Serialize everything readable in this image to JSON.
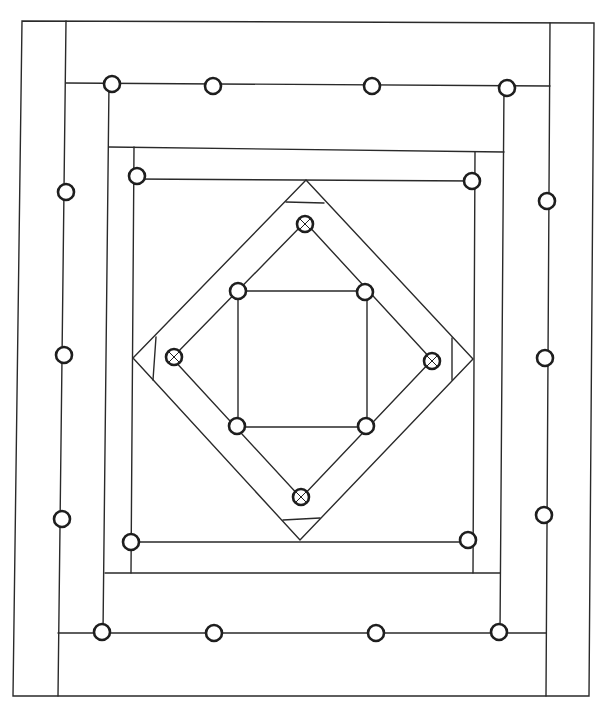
{
  "diagram": {
    "title": "",
    "type": "quilt-block-line-drawing",
    "colors": {
      "background": "#ffffff",
      "line": "#2a2a2a",
      "marker": "#1e1e1e"
    },
    "frames": [
      {
        "name": "outer-border",
        "points": [
          [
            22,
            21
          ],
          [
            594,
            23
          ],
          [
            589,
            696
          ],
          [
            13,
            696
          ]
        ]
      },
      {
        "name": "left-strip-inner-edge",
        "points": [
          [
            66,
            21
          ],
          [
            58,
            696
          ]
        ]
      },
      {
        "name": "right-strip-inner-edge",
        "points": [
          [
            550,
            23
          ],
          [
            546,
            696
          ]
        ]
      },
      {
        "name": "top-strip-bottom-edge",
        "points": [
          [
            66,
            83
          ],
          [
            550,
            86
          ]
        ]
      },
      {
        "name": "bottom-strip-top-edge",
        "points": [
          [
            58,
            633
          ],
          [
            546,
            633
          ]
        ]
      },
      {
        "name": "second-frame-left",
        "points": [
          [
            109,
            83
          ],
          [
            103,
            633
          ]
        ]
      },
      {
        "name": "second-frame-right",
        "points": [
          [
            504,
            86
          ],
          [
            500,
            633
          ]
        ]
      },
      {
        "name": "second-frame-top",
        "points": [
          [
            109,
            147
          ],
          [
            504,
            152
          ]
        ]
      },
      {
        "name": "second-frame-bottom",
        "points": [
          [
            105,
            573
          ],
          [
            500,
            573
          ]
        ]
      },
      {
        "name": "inner-square-left",
        "points": [
          [
            134,
            147
          ],
          [
            131,
            573
          ]
        ]
      },
      {
        "name": "inner-square-right",
        "points": [
          [
            475,
            152
          ],
          [
            473,
            573
          ]
        ]
      },
      {
        "name": "inner-square-top",
        "points": [
          [
            134,
            179
          ],
          [
            475,
            181
          ]
        ]
      },
      {
        "name": "inner-square-bottom",
        "points": [
          [
            131,
            542
          ],
          [
            473,
            542
          ]
        ]
      }
    ],
    "outer_diamond": [
      [
        306,
        180
      ],
      [
        473,
        359
      ],
      [
        300,
        540
      ],
      [
        133,
        358
      ]
    ],
    "inner_diamond": [
      [
        305,
        222
      ],
      [
        432,
        360
      ],
      [
        301,
        498
      ],
      [
        172,
        358
      ]
    ],
    "center_square": [
      [
        238,
        291
      ],
      [
        367,
        291
      ],
      [
        367,
        427
      ],
      [
        238,
        427
      ]
    ],
    "diamond_cross_bars": [
      [
        [
          286,
          202
        ],
        [
          324,
          203
        ]
      ],
      [
        [
          156,
          337
        ],
        [
          153,
          380
        ]
      ],
      [
        [
          452,
          338
        ],
        [
          452,
          380
        ]
      ],
      [
        [
          283,
          520
        ],
        [
          320,
          518
        ]
      ]
    ],
    "markers": [
      {
        "x": 112,
        "y": 84,
        "r": 8,
        "crossed": false
      },
      {
        "x": 213,
        "y": 86,
        "r": 8,
        "crossed": false
      },
      {
        "x": 372,
        "y": 86,
        "r": 8,
        "crossed": false
      },
      {
        "x": 507,
        "y": 88,
        "r": 8,
        "crossed": false
      },
      {
        "x": 66,
        "y": 192,
        "r": 8,
        "crossed": false
      },
      {
        "x": 137,
        "y": 176,
        "r": 8,
        "crossed": false
      },
      {
        "x": 472,
        "y": 181,
        "r": 8,
        "crossed": false
      },
      {
        "x": 547,
        "y": 201,
        "r": 8,
        "crossed": false
      },
      {
        "x": 64,
        "y": 355,
        "r": 8,
        "crossed": false
      },
      {
        "x": 545,
        "y": 358,
        "r": 8,
        "crossed": false
      },
      {
        "x": 62,
        "y": 519,
        "r": 8,
        "crossed": false
      },
      {
        "x": 544,
        "y": 515,
        "r": 8,
        "crossed": false
      },
      {
        "x": 131,
        "y": 542,
        "r": 8,
        "crossed": false
      },
      {
        "x": 468,
        "y": 540,
        "r": 8,
        "crossed": false
      },
      {
        "x": 102,
        "y": 632,
        "r": 8,
        "crossed": false
      },
      {
        "x": 214,
        "y": 633,
        "r": 8,
        "crossed": false
      },
      {
        "x": 376,
        "y": 633,
        "r": 8,
        "crossed": false
      },
      {
        "x": 499,
        "y": 632,
        "r": 8,
        "crossed": false
      },
      {
        "x": 305,
        "y": 224,
        "r": 8,
        "crossed": true
      },
      {
        "x": 238,
        "y": 291,
        "r": 8,
        "crossed": false
      },
      {
        "x": 365,
        "y": 292,
        "r": 8,
        "crossed": false
      },
      {
        "x": 174,
        "y": 357,
        "r": 8,
        "crossed": true
      },
      {
        "x": 432,
        "y": 361,
        "r": 8,
        "crossed": true
      },
      {
        "x": 237,
        "y": 426,
        "r": 8,
        "crossed": false
      },
      {
        "x": 366,
        "y": 426,
        "r": 8,
        "crossed": false
      },
      {
        "x": 301,
        "y": 497,
        "r": 8,
        "crossed": true
      }
    ]
  }
}
